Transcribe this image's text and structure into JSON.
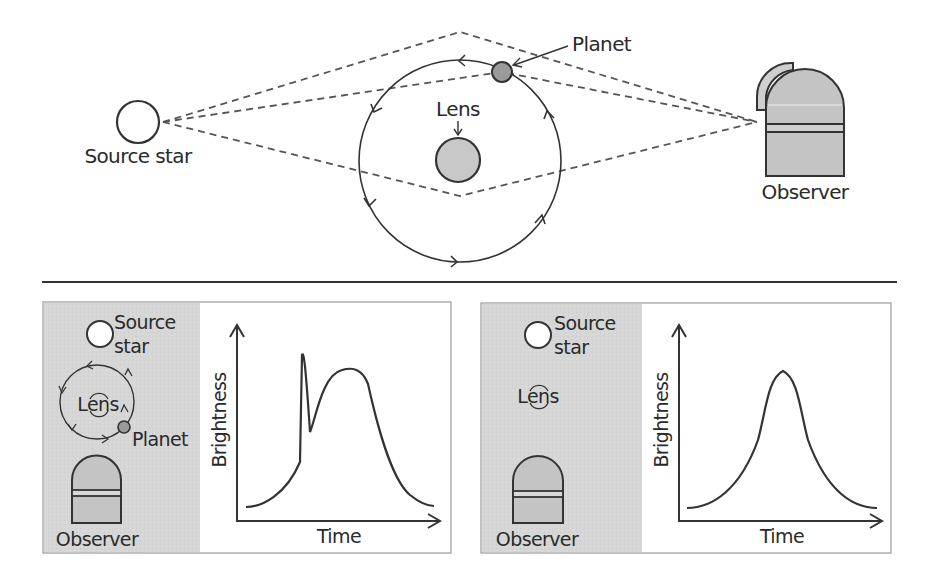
{
  "diagram": {
    "colors": {
      "line": "#333333",
      "dash": "#555555",
      "panel_gray": "#d9d9d9",
      "lens_fill": "#c8c8c8",
      "planet_fill": "#9a9a9a",
      "observer_fill": "#c4c4c4",
      "source_fill": "#ffffff"
    },
    "top": {
      "source_label": "Source star",
      "lens_label": "Lens",
      "planet_label": "Planet",
      "observer_label": "Observer"
    },
    "panel_left": {
      "source_label_line1": "Source",
      "source_label_line2": "star",
      "lens_label": "Lens",
      "planet_label": "Planet",
      "observer_label": "Observer",
      "y_axis_label": "Brightness",
      "x_axis_label": "Time",
      "curve_description": "Light curve with a sharp planetary spike before the main lensing peak"
    },
    "panel_right": {
      "source_label_line1": "Source",
      "source_label_line2": "star",
      "lens_label": "Lens",
      "observer_label": "Observer",
      "y_axis_label": "Brightness",
      "x_axis_label": "Time",
      "curve_description": "Symmetric single-lens light curve"
    }
  }
}
